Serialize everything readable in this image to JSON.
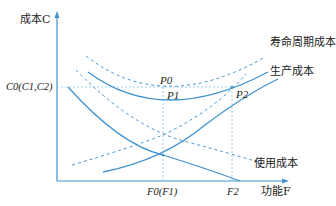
{
  "diagram": {
    "title": "",
    "colors": {
      "curve": "#3f93cf",
      "guide": "#8cc4e8",
      "text": "#222222"
    },
    "y_axis": {
      "label": "成本C"
    },
    "x_axis": {
      "label": "功能F"
    },
    "y_ticks": [
      {
        "label": "C0(C1,C2)"
      }
    ],
    "x_ticks": [
      {
        "label": "F0(F1)"
      },
      {
        "label": "F2"
      }
    ],
    "points": [
      {
        "label": "P0"
      },
      {
        "label": "P1"
      },
      {
        "label": "P2"
      }
    ],
    "curves": [
      {
        "name": "寿命周期成本",
        "style": "dashed+solid",
        "shape": "U"
      },
      {
        "name": "生产成本",
        "style": "solid+dashed",
        "shape": "increasing"
      },
      {
        "name": "使用成本",
        "style": "solid+dashed",
        "shape": "decreasing"
      }
    ],
    "labels": {
      "life_cycle": "寿命周期成本",
      "production": "生产成本",
      "usage": "使用成本"
    }
  }
}
